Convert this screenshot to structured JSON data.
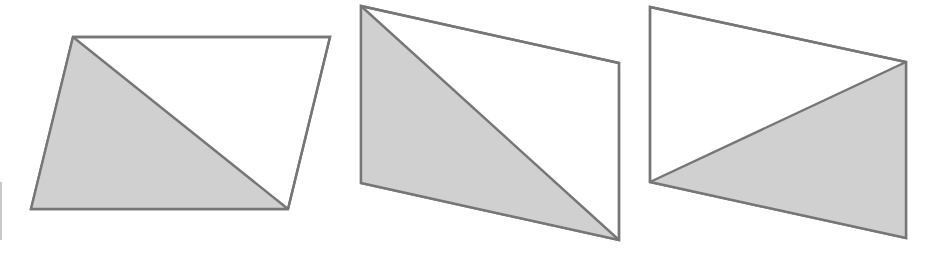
{
  "figure": {
    "colors": {
      "shade": "#d0d0d0",
      "stroke": "#767676",
      "background": "#ffffff"
    },
    "shapes": [
      {
        "id": "parallelogram-1",
        "shaded_triangle": "lower-left",
        "diagonal": "top-left to bottom-right"
      },
      {
        "id": "parallelogram-2",
        "shaded_triangle": "left",
        "diagonal": "top-left to bottom-right"
      },
      {
        "id": "parallelogram-3",
        "shaded_triangle": "lower-right",
        "diagonal": "bottom-left to top-right"
      }
    ]
  }
}
